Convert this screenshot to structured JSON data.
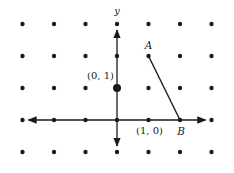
{
  "diagram": {
    "grid": {
      "x_range": [
        -3,
        3
      ],
      "y_range": [
        -1,
        3
      ]
    },
    "axes": {
      "y_label": "y",
      "x_label": ""
    },
    "highlighted_point": {
      "coords": [
        0,
        1
      ],
      "label": "(0, 1)"
    },
    "points": [
      {
        "name": "A",
        "coords": [
          1,
          2
        ],
        "label": "A"
      },
      {
        "name": "B",
        "coords": [
          2,
          0
        ],
        "label": "B"
      },
      {
        "name": "e1",
        "coords": [
          1,
          0
        ],
        "label": "(1, 0)"
      }
    ],
    "segment": {
      "from": "A",
      "to": "B"
    },
    "colors": {
      "ink": "#1a1a1a",
      "background": "#ffffff"
    }
  }
}
